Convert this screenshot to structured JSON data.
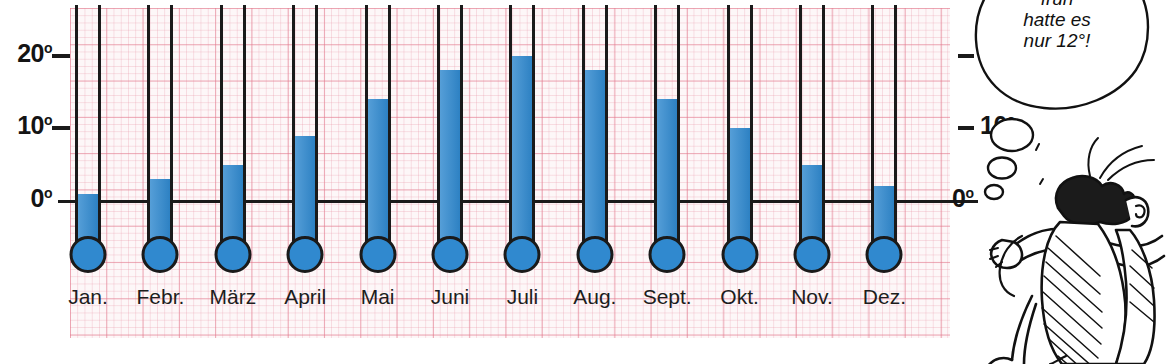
{
  "chart_data": {
    "type": "bar",
    "title": "",
    "xlabel": "",
    "ylabel": "",
    "ylim": [
      0,
      22
    ],
    "grid": true,
    "legend_position": "none",
    "unit": "°C",
    "categories": [
      "Jan.",
      "Febr.",
      "März",
      "April",
      "Mai",
      "Juni",
      "Juli",
      "Aug.",
      "Sept.",
      "Okt.",
      "Nov.",
      "Dez."
    ],
    "values": [
      1,
      3,
      5,
      9,
      14,
      18,
      20,
      18,
      14,
      10,
      5,
      2
    ],
    "series": [
      {
        "name": "Monatliche Temperatur",
        "values": [
          1,
          3,
          5,
          9,
          14,
          18,
          20,
          18,
          14,
          10,
          5,
          2
        ]
      }
    ],
    "axis_left": {
      "ticks": [
        {
          "value": 20,
          "label": "20",
          "sup": "o"
        },
        {
          "value": 10,
          "label": "10",
          "sup": "o"
        },
        {
          "value": 0,
          "label": "0",
          "sup": "o"
        }
      ]
    },
    "axis_right": {
      "ticks": [
        {
          "value": 20,
          "label": "20",
          "sup": "o",
          "dash": true
        },
        {
          "value": 10,
          "label": "10",
          "sup": "o",
          "dash": true
        },
        {
          "value": 0,
          "label": "0",
          "sup": "o",
          "dash": false
        }
      ]
    }
  },
  "cartoon": {
    "speech_bubble": {
      "lines": [
        "früh",
        "hatte es",
        "nur 12°!"
      ]
    }
  },
  "colors": {
    "mercury": "#3089cf",
    "outline": "#1a1a1a",
    "grid_major": "#e2788c",
    "grid_minor": "#e896a8",
    "paper": "#fdf7f8"
  }
}
